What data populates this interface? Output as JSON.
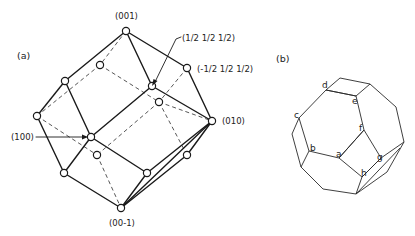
{
  "panels": {
    "a": {
      "label": "(a)",
      "annotations": {
        "top": "(001)",
        "half_pos": "(1/2 1/2 1/2)",
        "half_neg": "(-1/2 1/2 1/2)",
        "right": "(010)",
        "left": "(100)",
        "bottom": "(00-1)"
      }
    },
    "b": {
      "label": "(b)",
      "vertex_labels": {
        "a": "a",
        "b": "b",
        "c": "c",
        "d": "d",
        "e": "e",
        "f": "f",
        "g": "g",
        "h": "h"
      }
    }
  },
  "colors": {
    "line": "#1a1a1a",
    "background": "#ffffff"
  }
}
